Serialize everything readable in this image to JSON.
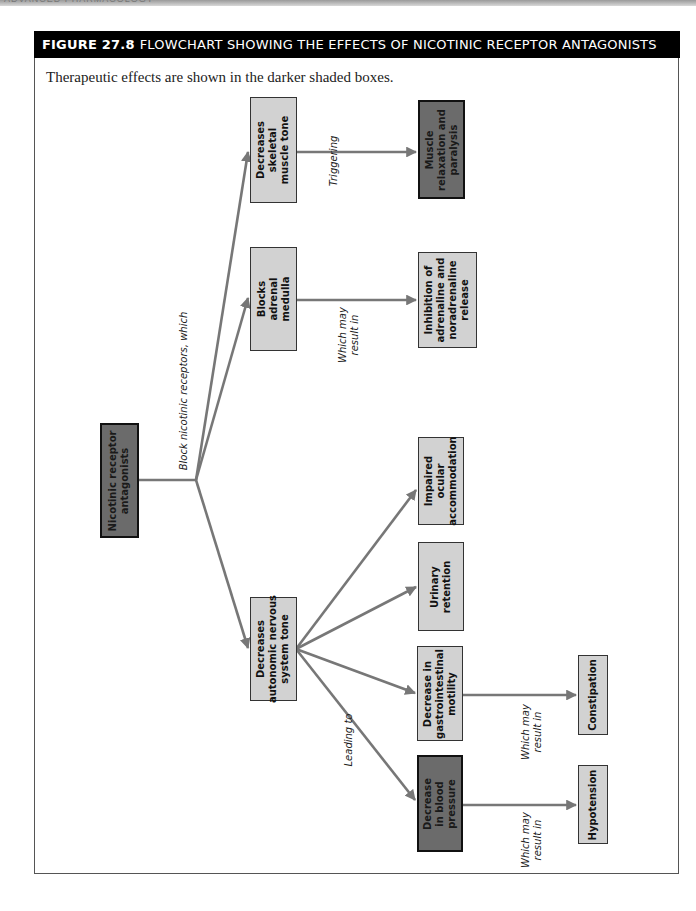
{
  "page": {
    "running_head": "ADVANCED PHARMACOLOGY"
  },
  "figure": {
    "number": "FIGURE 27.8",
    "title": "FLOWCHART SHOWING THE EFFECTS OF NICOTINIC RECEPTOR ANTAGONISTS",
    "caption": "Therapeutic effects are shown in the darker shaded boxes."
  },
  "colors": {
    "therapeutic_box": "#6b6b6b",
    "other_box": "#d2d2d2",
    "arrow": "#777777",
    "title_bar": "#000000"
  },
  "nodes": {
    "root": {
      "line1": "Nicotinic receptor",
      "line2": "antagonists",
      "therapeutic": true
    },
    "skeletal": {
      "line1": "Decreases",
      "line2": "skeletal",
      "line3": "muscle tone",
      "therapeutic": false
    },
    "muscle_relax": {
      "line1": "Muscle",
      "line2": "relaxation and",
      "line3": "paralysis",
      "therapeutic": true
    },
    "adrenal": {
      "line1": "Blocks",
      "line2": "adrenal",
      "line3": "medulla",
      "therapeutic": false
    },
    "inhibition": {
      "line1": "Inhibition of",
      "line2": "adrenaline and",
      "line3": "noradrenaline",
      "line4": "release",
      "therapeutic": false
    },
    "autonomic": {
      "line1": "Decreases",
      "line2": "autonomic nervous",
      "line3": "system tone",
      "therapeutic": false
    },
    "ocular": {
      "line1": "Impaired",
      "line2": "ocular",
      "line3": "accommodation",
      "therapeutic": false
    },
    "urinary": {
      "line1": "Urinary",
      "line2": "retention",
      "therapeutic": false
    },
    "gi": {
      "line1": "Decrease in",
      "line2": "gastrointestinal",
      "line3": "motility",
      "therapeutic": false
    },
    "constipation": {
      "line1": "Constipation",
      "therapeutic": false
    },
    "blood_pressure": {
      "line1": "Decrease",
      "line2": "in blood",
      "line3": "pressure",
      "therapeutic": true
    },
    "hypotension": {
      "line1": "Hypotension",
      "therapeutic": false
    }
  },
  "edge_labels": {
    "block": "Block nicotinic receptors, which",
    "triggering": "Triggering",
    "adrenal_result": {
      "line1": "Which may",
      "line2": "result in"
    },
    "leading_to": "Leading to",
    "gi_result": {
      "line1": "Which may",
      "line2": "result in"
    },
    "bp_result": {
      "line1": "Which may",
      "line2": "result in"
    }
  }
}
